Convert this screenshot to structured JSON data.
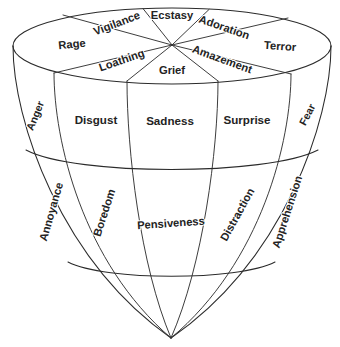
{
  "diagram": {
    "name": "plutchik-emotion-cone",
    "background_color": "#ffffff",
    "line_color": "#2b2b2b",
    "text_color": "#232323"
  },
  "top_surface": {
    "description": "Top elliptical face divided into eight radial wedges of intense emotions",
    "labels": [
      {
        "id": "rage",
        "text": "Rage",
        "x": 72,
        "y": 45,
        "rotate": -6,
        "size_class": "sz-top"
      },
      {
        "id": "vigilance",
        "text": "Vigilance",
        "x": 117,
        "y": 24,
        "rotate": -21,
        "size_class": "sz-top"
      },
      {
        "id": "ecstasy",
        "text": "Ecstasy",
        "x": 172,
        "y": 16,
        "rotate": 0,
        "size_class": "sz-top"
      },
      {
        "id": "adoration",
        "text": "Adoration",
        "x": 224,
        "y": 28,
        "rotate": 19,
        "size_class": "sz-top"
      },
      {
        "id": "terror",
        "text": "Terror",
        "x": 280,
        "y": 47,
        "rotate": 4,
        "size_class": "sz-top"
      },
      {
        "id": "amazement",
        "text": "Amazement",
        "x": 222,
        "y": 60,
        "rotate": 20,
        "size_class": "sz-top"
      },
      {
        "id": "grief",
        "text": "Grief",
        "x": 172,
        "y": 71,
        "rotate": 0,
        "size_class": "sz-top"
      },
      {
        "id": "loathing",
        "text": "Loathing",
        "x": 122,
        "y": 61,
        "rotate": -19,
        "size_class": "sz-top"
      }
    ]
  },
  "middle_band": {
    "description": "Middle band of the cone showing moderate-intensity basic emotions",
    "labels": [
      {
        "id": "anger",
        "text": "Anger",
        "x": 36,
        "y": 116,
        "rotate": -68,
        "size_class": "sz-side"
      },
      {
        "id": "disgust",
        "text": "Disgust",
        "x": 96,
        "y": 121,
        "rotate": 0,
        "size_class": "sz-mid"
      },
      {
        "id": "sadness",
        "text": "Sadness",
        "x": 170,
        "y": 122,
        "rotate": 0,
        "size_class": "sz-mid"
      },
      {
        "id": "surprise",
        "text": "Surprise",
        "x": 247,
        "y": 121,
        "rotate": 0,
        "size_class": "sz-mid"
      },
      {
        "id": "fear",
        "text": "Fear",
        "x": 308,
        "y": 115,
        "rotate": -62,
        "size_class": "sz-side"
      }
    ]
  },
  "lower_band": {
    "description": "Lower band of the cone showing mild-intensity emotions tapering to a point",
    "labels": [
      {
        "id": "annoyance",
        "text": "Annoyance",
        "x": 52,
        "y": 212,
        "rotate": -74,
        "size_class": "sz-low"
      },
      {
        "id": "boredom",
        "text": "Boredom",
        "x": 105,
        "y": 213,
        "rotate": -72,
        "size_class": "sz-low"
      },
      {
        "id": "pensiveness",
        "text": "Pensiveness",
        "x": 171,
        "y": 224,
        "rotate": -4,
        "size_class": "sz-low"
      },
      {
        "id": "distraction",
        "text": "Distraction",
        "x": 238,
        "y": 215,
        "rotate": -61,
        "size_class": "sz-low"
      },
      {
        "id": "apprehension",
        "text": "Apprehension",
        "x": 288,
        "y": 212,
        "rotate": -72,
        "size_class": "sz-low"
      }
    ]
  },
  "geometry": {
    "top_ellipse": {
      "cx": 172,
      "cy": 46,
      "rx": 159,
      "ry": 38
    },
    "apex": {
      "x": 171,
      "y": 338
    },
    "radial_center": {
      "x": 172,
      "y": 45
    },
    "mid_arc_y": 152,
    "low_arc_y": 264
  }
}
